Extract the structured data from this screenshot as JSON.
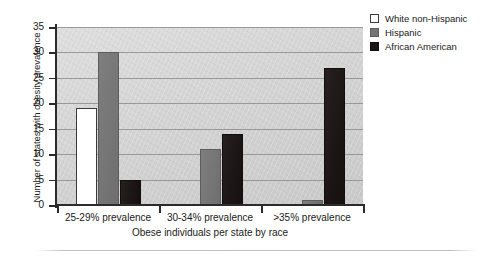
{
  "chart_data": {
    "type": "bar",
    "title": "",
    "subtitle": "",
    "xlabel": "Obese individuals per state by race",
    "ylabel": "Number of states with obesity prevalence",
    "categories": [
      "25-29% prevalence",
      "30-34% prevalence",
      ">35% prevalence"
    ],
    "series": [
      {
        "name": "White non-Hispanic",
        "values": [
          19,
          0,
          0
        ],
        "color": "#ffffff"
      },
      {
        "name": "Hispanic",
        "values": [
          30,
          11,
          1
        ],
        "color": "#757575"
      },
      {
        "name": "African American",
        "values": [
          5,
          14,
          27
        ],
        "color": "#1b1414"
      }
    ],
    "ylim": [
      0,
      35
    ],
    "yticks": [
      0,
      5,
      10,
      15,
      20,
      25,
      30,
      35
    ],
    "ytick_labels": [
      "0",
      "5",
      "10",
      "15",
      "20",
      "25",
      "30",
      "35"
    ],
    "grid": true,
    "grid_axis": "y",
    "legend_position": "top-right",
    "plot_background": "#d6d6d6"
  },
  "legend": {
    "items": [
      {
        "label": "White non-Hispanic",
        "swatch": "white-swatch-icon"
      },
      {
        "label": "Hispanic",
        "swatch": "gray-swatch-icon"
      },
      {
        "label": "African American",
        "swatch": "black-swatch-icon"
      }
    ]
  },
  "axes": {
    "y_title": "Number of states with obesity prevalence",
    "x_title": "Obese individuals per state by race"
  }
}
